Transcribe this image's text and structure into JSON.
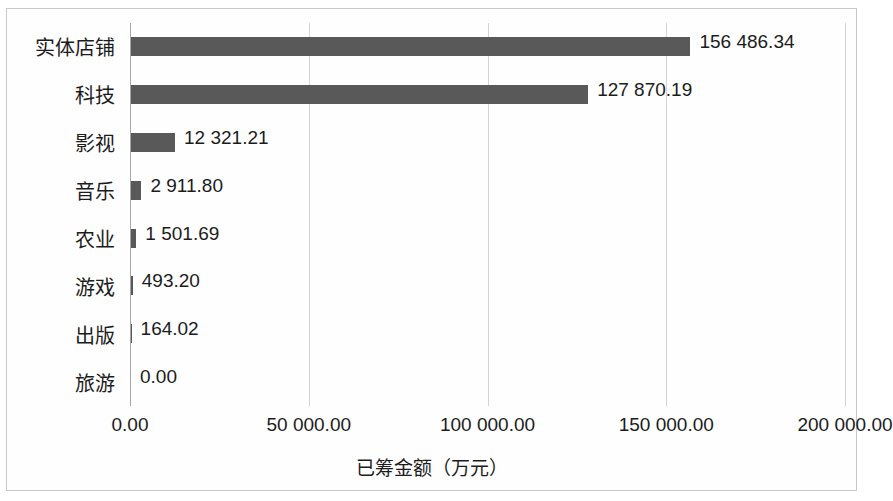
{
  "chart_data": {
    "type": "bar",
    "orientation": "horizontal",
    "title": "",
    "xlabel": "已筹金额（万元）",
    "ylabel": "",
    "categories": [
      "实体店铺",
      "科技",
      "影视",
      "音乐",
      "农业",
      "游戏",
      "出版",
      "旅游"
    ],
    "values": [
      156486.34,
      127870.19,
      12321.21,
      2911.8,
      1501.69,
      493.2,
      164.02,
      0.0
    ],
    "data_labels": [
      "156 486.34",
      "127 870.19",
      "12 321.21",
      "2 911.80",
      "1 501.69",
      "493.20",
      "164.02",
      "0.00"
    ],
    "xlim": [
      0,
      200000
    ],
    "xticks": [
      0,
      50000,
      100000,
      150000,
      200000
    ],
    "xtick_labels": [
      "0.00",
      "50 000.00",
      "100 000.00",
      "150 000.00",
      "200 000.00"
    ],
    "grid": "vertical",
    "legend": "none",
    "series_name": "已筹金额（万元）",
    "bar_color": "#595959",
    "gridline_color": "#d4d4d4",
    "axis_color": "#a6a6a6",
    "background_color": "#fefefe",
    "border_color": "#c9c9c9"
  }
}
